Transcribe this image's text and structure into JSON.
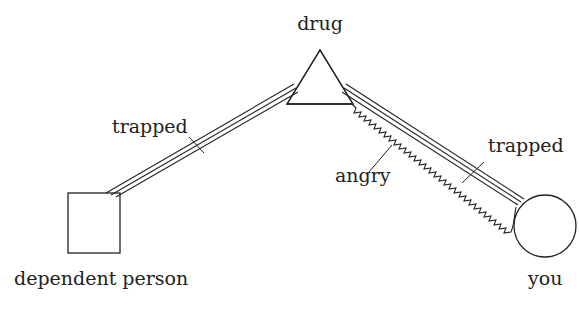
{
  "diagram": {
    "nodes": [
      {
        "id": "drug",
        "label": "drug",
        "shape": "triangle"
      },
      {
        "id": "dependent_person",
        "label": "dependent person",
        "shape": "square"
      },
      {
        "id": "you",
        "label": "you",
        "shape": "circle"
      }
    ],
    "edges": [
      {
        "from": "drug",
        "to": "dependent_person",
        "style": "triple-line",
        "label": "trapped"
      },
      {
        "from": "drug",
        "to": "you",
        "style": "triple-line",
        "label": "trapped"
      },
      {
        "from": "drug",
        "to": "you",
        "style": "zigzag",
        "label": "angry"
      }
    ],
    "labels": {
      "drug": "drug",
      "dependent_person": "dependent person",
      "you": "you",
      "trapped_left": "trapped",
      "trapped_right": "trapped",
      "angry": "angry"
    },
    "colors": {
      "ink": "#222222",
      "background": "#ffffff"
    }
  }
}
